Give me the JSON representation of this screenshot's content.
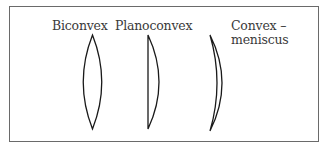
{
  "figure": {
    "lenses": [
      {
        "id": "biconvex",
        "label": "Biconvex"
      },
      {
        "id": "planoconvex",
        "label": "Planoconvex"
      },
      {
        "id": "convex-meniscus",
        "label_line1": "Convex –",
        "label_line2": "meniscus"
      }
    ],
    "colors": {
      "stroke": "#1a1a1a",
      "border": "#6a6a6a",
      "text": "#3a3a3a"
    }
  }
}
